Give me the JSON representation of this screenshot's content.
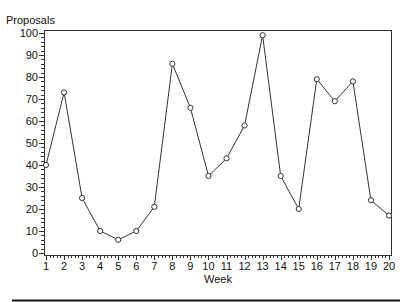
{
  "chart_data": {
    "type": "line",
    "title": "",
    "xlabel": "Week",
    "ylabel": "Proposals",
    "x": [
      1,
      2,
      3,
      4,
      5,
      6,
      7,
      8,
      9,
      10,
      11,
      12,
      13,
      14,
      15,
      16,
      17,
      18,
      19,
      20
    ],
    "series": [
      {
        "name": "Proposals",
        "values": [
          40,
          73,
          25,
          10,
          6,
          10,
          21,
          86,
          66,
          35,
          43,
          58,
          99,
          35,
          20,
          79,
          69,
          78,
          24,
          17
        ],
        "marker": "circle",
        "color": "#333333"
      }
    ],
    "xlim": [
      1,
      20
    ],
    "ylim": [
      0,
      100
    ],
    "xticks": [
      1,
      2,
      3,
      4,
      5,
      6,
      7,
      8,
      9,
      10,
      11,
      12,
      13,
      14,
      15,
      16,
      17,
      18,
      19,
      20
    ],
    "yticks": [
      0,
      10,
      20,
      30,
      40,
      50,
      60,
      70,
      80,
      90,
      100
    ],
    "grid": false,
    "legend": null
  }
}
